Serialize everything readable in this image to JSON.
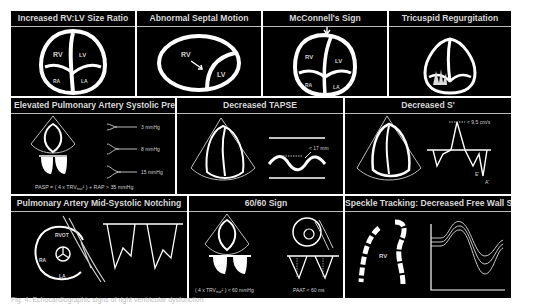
{
  "figure": {
    "caption": "Fig. 4. Echocardiographic signs of right ventricular dysfunction",
    "colors": {
      "background": "#000000",
      "foreground": "#ffffff",
      "border": "#ffffff"
    },
    "panels": [
      {
        "id": "rv-lv-ratio",
        "title": "Increased RV:LV Size Ratio",
        "labels": [
          "RV",
          "LV",
          "RA",
          "LA"
        ]
      },
      {
        "id": "septal-motion",
        "title": "Abnormal Septal Motion",
        "labels": [
          "RV",
          "LV"
        ]
      },
      {
        "id": "mcconnell",
        "title": "McConnell's Sign",
        "labels": [
          "RV",
          "LV",
          "RA",
          "LA"
        ]
      },
      {
        "id": "tricuspid",
        "title": "Tricuspid Regurgitation"
      },
      {
        "id": "pasp",
        "title": "Elevated Pulmonary Artery Systolic Pressure",
        "pressures": [
          "3 mmHg",
          "8 mmHg",
          "15 mmHg"
        ],
        "formula_prefix": "PASP = ( 4 x TRV",
        "formula_sub": "max",
        "formula_suffix": "² ) + RAP > 35 mmHg"
      },
      {
        "id": "tapse",
        "title": "Decreased TAPSE",
        "threshold": "< 17 mm"
      },
      {
        "id": "s-prime",
        "title": "Decreased S'",
        "threshold": "< 9.5 cm/s",
        "labels": [
          "E'",
          "A'"
        ]
      },
      {
        "id": "notching",
        "title": "Pulmonary Artery Mid-Systolic Notching",
        "labels": [
          "RVOT",
          "RA",
          "LA"
        ]
      },
      {
        "id": "sixty-sixty",
        "title": "60/60 Sign",
        "formula_left": "( 4 x TRV",
        "formula_sub": "max",
        "formula_left_suffix": "² ) < 60 mmHg",
        "formula_right": "PAAT < 60 ms"
      },
      {
        "id": "speckle",
        "title": "Speckle Tracking: Decreased Free Wall Strain",
        "labels": [
          "RV"
        ]
      }
    ]
  }
}
